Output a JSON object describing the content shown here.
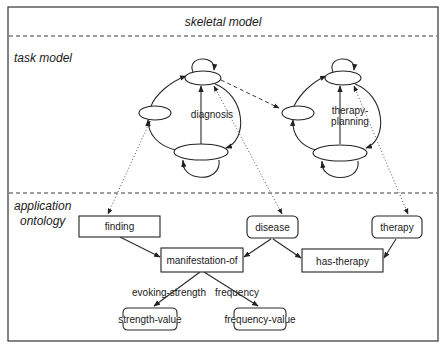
{
  "sections": {
    "skeletal": "skeletal model",
    "task": "task model",
    "application_line1": "application",
    "application_line2": "ontology"
  },
  "task_model": {
    "cycles": [
      {
        "label": "diagnosis"
      },
      {
        "label_line1": "therapy-",
        "label_line2": "planning"
      }
    ]
  },
  "ontology": {
    "nodes": [
      {
        "id": "finding",
        "label": "finding",
        "shape": "rect"
      },
      {
        "id": "disease",
        "label": "disease",
        "shape": "rounded"
      },
      {
        "id": "therapy",
        "label": "therapy",
        "shape": "rounded"
      },
      {
        "id": "manifestation-of",
        "label": "manifestation-of",
        "shape": "rect"
      },
      {
        "id": "has-therapy",
        "label": "has-therapy",
        "shape": "rect"
      },
      {
        "id": "strength-value",
        "label": "strength-value",
        "shape": "bracket"
      },
      {
        "id": "frequency-value",
        "label": "frequency-value",
        "shape": "bracket"
      }
    ],
    "edge_labels": {
      "evoking_strength": "evoking-strength",
      "frequency": "frequency"
    },
    "edges": [
      {
        "from": "finding",
        "to": "manifestation-of"
      },
      {
        "from": "disease",
        "to": "manifestation-of"
      },
      {
        "from": "disease",
        "to": "has-therapy"
      },
      {
        "from": "therapy",
        "to": "has-therapy"
      },
      {
        "from": "manifestation-of",
        "to": "strength-value",
        "label": "evoking-strength"
      },
      {
        "from": "manifestation-of",
        "to": "frequency-value",
        "label": "frequency"
      }
    ]
  },
  "colors": {
    "line": "#222222",
    "background": "#ffffff"
  }
}
